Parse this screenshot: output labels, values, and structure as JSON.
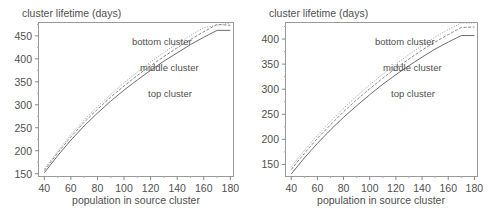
{
  "figure": {
    "background_color": "#ffffff",
    "axis_color": "#808080",
    "text_color": "#4f4f4f",
    "panels": [
      {
        "panel_name": "left-panel",
        "chart_data": {
          "type": "line",
          "title": "",
          "ylabel": "cluster lifetime (days)",
          "xlabel": "population in source cluster",
          "xlim": [
            36,
            182
          ],
          "ylim": [
            145,
            478
          ],
          "xticks": [
            40,
            60,
            80,
            100,
            120,
            140,
            160,
            180
          ],
          "yticks": [
            150,
            200,
            250,
            300,
            350,
            400,
            450
          ],
          "grid": false,
          "legend_position": "inline-annotations",
          "annotations": [
            "bottom cluster",
            "middle cluster",
            "top cluster"
          ],
          "x": [
            40,
            50,
            60,
            70,
            80,
            90,
            100,
            110,
            120,
            130,
            140,
            150,
            160,
            170,
            180
          ],
          "series": [
            {
              "name": "bottom cluster",
              "style": "dotted",
              "color": "#9a9a9a",
              "values": [
                160,
                199,
                235,
                267,
                296,
                323,
                348,
                371,
                393,
                414,
                433,
                451,
                468,
                484,
                478
              ]
            },
            {
              "name": "middle cluster",
              "style": "dashed",
              "color": "#8a8a8a",
              "values": [
                157,
                195,
                230,
                262,
                290,
                317,
                341,
                364,
                385,
                405,
                424,
                442,
                459,
                475,
                473
              ]
            },
            {
              "name": "top cluster",
              "style": "solid",
              "color": "#6e6e6e",
              "values": [
                152,
                189,
                223,
                254,
                282,
                308,
                332,
                354,
                375,
                395,
                413,
                431,
                447,
                462,
                462
              ]
            }
          ]
        }
      },
      {
        "panel_name": "right-panel",
        "chart_data": {
          "type": "line",
          "title": "",
          "ylabel": "cluster lifetime (days)",
          "xlabel": "population in source cluster",
          "xlim": [
            36,
            182
          ],
          "ylim": [
            127,
            432
          ],
          "xticks": [
            40,
            60,
            80,
            100,
            120,
            140,
            160,
            180
          ],
          "yticks": [
            150,
            200,
            250,
            300,
            350,
            400
          ],
          "grid": false,
          "legend_position": "inline-annotations",
          "annotations": [
            "bottom cluster",
            "middle cluster",
            "top cluster"
          ],
          "x": [
            40,
            50,
            60,
            70,
            80,
            90,
            100,
            110,
            120,
            130,
            140,
            150,
            160,
            170,
            180
          ],
          "series": [
            {
              "name": "bottom cluster",
              "style": "dotted",
              "color": "#9a9a9a",
              "values": [
                146,
                178,
                208,
                236,
                262,
                286,
                309,
                330,
                350,
                369,
                387,
                404,
                419,
                432,
                432
              ]
            },
            {
              "name": "middle cluster",
              "style": "dashed",
              "color": "#8a8a8a",
              "values": [
                140,
                172,
                202,
                229,
                255,
                279,
                301,
                322,
                342,
                360,
                378,
                394,
                409,
                423,
                424
              ]
            },
            {
              "name": "top cluster",
              "style": "solid",
              "color": "#6e6e6e",
              "values": [
                131,
                163,
                192,
                219,
                244,
                267,
                289,
                310,
                329,
                347,
                364,
                380,
                394,
                407,
                407
              ]
            }
          ]
        }
      }
    ]
  }
}
